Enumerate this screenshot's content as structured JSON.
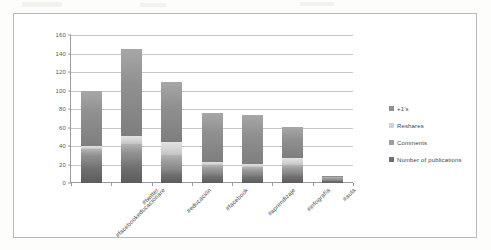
{
  "chart_data": {
    "type": "bar",
    "subtype": "stacked-bar",
    "title": "",
    "xlabel": "",
    "ylabel": "",
    "ylim": [
      0,
      160
    ],
    "yticks": [
      0,
      20,
      40,
      60,
      80,
      100,
      120,
      140,
      160
    ],
    "grid": true,
    "legend_position": "right",
    "categories": [
      "#facebookeducacionare",
      "#twitter",
      "#educación",
      "#facebook",
      "#aprendizaje",
      "#infografía",
      "#aula"
    ],
    "series": [
      {
        "name": "Number of publications",
        "color": "#6f6f6f",
        "values": [
          28,
          30,
          16,
          12,
          11,
          12,
          3
        ]
      },
      {
        "name": "Comments",
        "color": "#9d9d9d",
        "values": [
          9,
          12,
          14,
          7,
          6,
          8,
          3
        ]
      },
      {
        "name": "Reshares",
        "color": "#d3d3d3",
        "values": [
          3,
          9,
          14,
          4,
          4,
          7,
          0
        ]
      },
      {
        "name": "+1's",
        "color": "#909090",
        "values": [
          60,
          94,
          65,
          53,
          53,
          34,
          2
        ]
      }
    ],
    "totals": [
      100,
      145,
      109,
      76,
      74,
      61,
      8
    ]
  },
  "legend": {
    "items": [
      {
        "label": "+1's",
        "color": "#909090"
      },
      {
        "label": "Reshares",
        "color": "#d3d3d3"
      },
      {
        "label": "Comments",
        "color": "#9d9d9d"
      },
      {
        "label": "Number of publications",
        "color": "#6f6f6f"
      }
    ]
  },
  "axis": {
    "y_tick_labels": [
      "0",
      "20",
      "40",
      "60",
      "80",
      "100",
      "120",
      "140",
      "160"
    ]
  }
}
